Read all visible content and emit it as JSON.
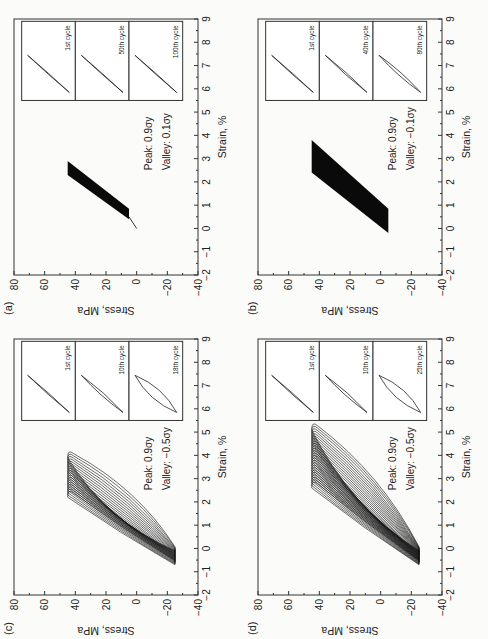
{
  "figure": {
    "panels": [
      {
        "id": "a",
        "label": "(a)",
        "peak": "Peak: 0.9σy",
        "valley": "Valley: 0.1σy",
        "insets": [
          "1st cycle",
          "50th cycle",
          "100th cycle"
        ]
      },
      {
        "id": "b",
        "label": "(b)",
        "peak": "Peak: 0.9σy",
        "valley": "Valley: −0.1σy",
        "insets": [
          "1st cycle",
          "40th cycle",
          "80th cycle"
        ]
      },
      {
        "id": "c",
        "label": "(c)",
        "peak": "Peak: 0.9σy",
        "valley": "Valley: −0.5σy",
        "insets": [
          "1st cycle",
          "10th cycle",
          "18th cycle"
        ]
      },
      {
        "id": "d",
        "label": "(d)",
        "peak": "Peak: 0.9σy",
        "valley": "Valley: −0.5σy",
        "insets": [
          "1st cycle",
          "10th cycle",
          "25th cycle"
        ]
      }
    ],
    "xlabel": "Strain, %",
    "ylabel": "Stress, MPa",
    "xticks": [
      "−2",
      "−1",
      "0",
      "1",
      "2",
      "3",
      "4",
      "5",
      "6",
      "7",
      "8",
      "9"
    ],
    "yticks": [
      "80",
      "60",
      "40",
      "20",
      "0",
      "−20",
      "−40"
    ]
  },
  "chart_data": [
    {
      "type": "line",
      "title": "(a) Peak 0.9σy, Valley 0.1σy",
      "xlabel": "Strain, %",
      "ylabel": "Stress, MPa",
      "xlim": [
        -2,
        9
      ],
      "ylim": [
        -40,
        80
      ],
      "orientation": "rotated 90° CCW",
      "series": [
        {
          "name": "hysteresis loops (ratcheting band)",
          "strain_range": [
            0.0,
            2.9
          ],
          "stress_range": [
            5,
            45
          ],
          "cycles": 100
        }
      ],
      "insets": [
        "1st cycle",
        "50th cycle",
        "100th cycle"
      ]
    },
    {
      "type": "line",
      "title": "(b) Peak 0.9σy, Valley −0.1σy",
      "xlabel": "Strain, %",
      "ylabel": "Stress, MPa",
      "xlim": [
        -2,
        9
      ],
      "ylim": [
        -40,
        80
      ],
      "series": [
        {
          "name": "hysteresis loops (ratcheting band)",
          "strain_range": [
            -0.2,
            3.8
          ],
          "stress_range": [
            -5,
            45
          ],
          "cycles": 80
        }
      ],
      "insets": [
        "1st cycle",
        "40th cycle",
        "80th cycle"
      ]
    },
    {
      "type": "line",
      "title": "(c) Peak 0.9σy, Valley −0.5σy",
      "xlabel": "Strain, %",
      "ylabel": "Stress, MPa",
      "xlim": [
        -2,
        9
      ],
      "ylim": [
        -40,
        80
      ],
      "series": [
        {
          "name": "hysteresis loops (growing)",
          "strain_range": [
            -0.7,
            4.3
          ],
          "stress_range": [
            -25,
            45
          ],
          "cycles": 18
        }
      ],
      "insets": [
        "1st cycle",
        "10th cycle",
        "18th cycle"
      ]
    },
    {
      "type": "line",
      "title": "(d) Peak 0.9σy, Valley −0.5σy",
      "xlabel": "Strain, %",
      "ylabel": "Stress, MPa",
      "xlim": [
        -2,
        9
      ],
      "ylim": [
        -40,
        80
      ],
      "series": [
        {
          "name": "hysteresis loops (growing)",
          "strain_range": [
            -0.7,
            5.2
          ],
          "stress_range": [
            -25,
            45
          ],
          "cycles": 25
        }
      ],
      "insets": [
        "1st cycle",
        "10th cycle",
        "25th cycle"
      ]
    }
  ]
}
